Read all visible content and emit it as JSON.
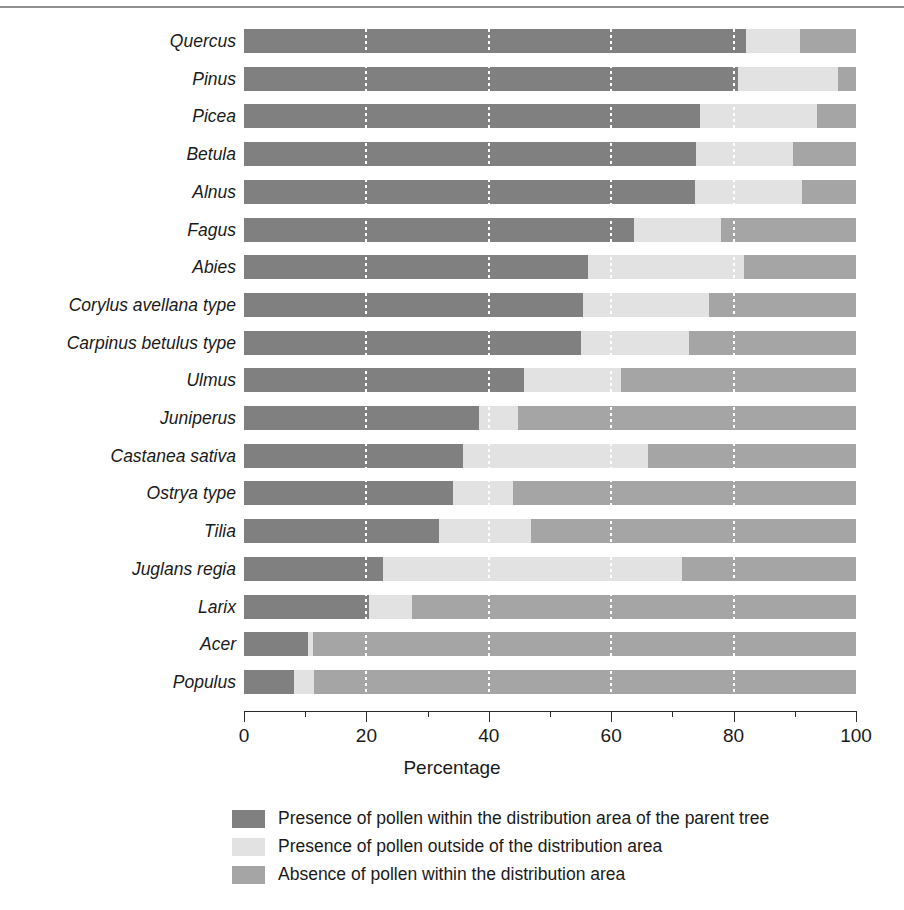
{
  "chart_data": {
    "type": "bar",
    "orientation": "horizontal",
    "stacked": true,
    "title": "",
    "xlabel": "Percentage",
    "ylabel": "",
    "xlim": [
      0,
      100
    ],
    "xticks": [
      0,
      20,
      40,
      60,
      80,
      100
    ],
    "xtick_labels": [
      "0",
      "20",
      "40",
      "60",
      "80",
      "100"
    ],
    "minor_xticks": [
      10,
      30,
      50,
      70,
      90
    ],
    "grid": "vertical dotted white gridlines at major ticks",
    "legend_position": "below axis, centered",
    "categories": [
      "Quercus",
      "Pinus",
      "Picea",
      "Betula",
      "Alnus",
      "Fagus",
      "Abies",
      "Corylus avellana type",
      "Carpinus betulus type",
      "Ulmus",
      "Juniperus",
      "Castanea sativa",
      "Ostrya type",
      "Tilia",
      "Juglans regia",
      "Larix",
      "Acer",
      "Populus"
    ],
    "series": [
      {
        "name": "Presence of pollen within the distribution area of the parent tree",
        "color": "#808080",
        "values": [
          82.0,
          80.7,
          74.5,
          73.9,
          73.7,
          63.7,
          56.2,
          55.4,
          55.1,
          45.8,
          38.4,
          35.8,
          34.2,
          31.9,
          22.7,
          20.4,
          10.5,
          8.2
        ]
      },
      {
        "name": "Presence of pollen outside of the distribution area",
        "color": "#e2e2e2",
        "values": [
          8.8,
          16.3,
          19.1,
          15.8,
          17.5,
          14.2,
          25.5,
          20.6,
          17.6,
          15.8,
          6.4,
          30.2,
          9.8,
          15.0,
          48.9,
          7.1,
          0.8,
          3.2
        ]
      },
      {
        "name": "Absence of pollen within the distribution area",
        "color": "#a5a5a5",
        "values": [
          9.2,
          3.0,
          6.4,
          10.3,
          8.8,
          22.1,
          18.3,
          24.0,
          27.3,
          38.4,
          55.2,
          34.0,
          56.0,
          53.1,
          28.4,
          72.5,
          88.7,
          88.6
        ]
      }
    ],
    "legend": [
      {
        "swatch": "#808080",
        "label": "Presence of pollen within the distribution area of the parent tree"
      },
      {
        "swatch": "#e2e2e2",
        "label": "Presence of pollen outside of the distribution area"
      },
      {
        "swatch": "#a5a5a5",
        "label": "Absence of pollen within the distribution area"
      }
    ]
  },
  "colors": {
    "series_0": "#808080",
    "series_1": "#e2e2e2",
    "series_2": "#a5a5a5",
    "axis": "#2b2b2b",
    "text": "#1a1a1a",
    "background": "#ffffff",
    "top_rule": "#8f8f8f"
  }
}
